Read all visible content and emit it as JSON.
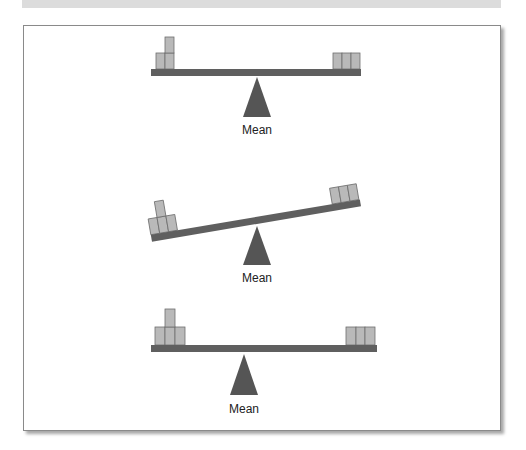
{
  "colors": {
    "beam": "#5f5f5f",
    "fulcrum": "#555555",
    "block_fill": "#b9b9b9",
    "block_stroke": "#6e6e6e",
    "frame_border": "#8a8a8a",
    "top_band": "#dcdcdc"
  },
  "seesaws": [
    {
      "id": "balanced-top",
      "fulcrum_label": "Mean",
      "left_blocks": {
        "count": 3,
        "arrangement": "2 bottom, 1 stacked"
      },
      "right_blocks": {
        "count": 3,
        "arrangement": "3 in a row"
      },
      "state": "balanced"
    },
    {
      "id": "tilted-middle",
      "fulcrum_label": "Mean",
      "left_blocks": {
        "count": 4,
        "arrangement": "3 bottom, 1 stacked"
      },
      "right_blocks": {
        "count": 3,
        "arrangement": "3 in a row"
      },
      "state": "tilted (left side down)"
    },
    {
      "id": "balanced-bottom",
      "fulcrum_label": "Mean",
      "left_blocks": {
        "count": 4,
        "arrangement": "3 bottom, 1 stacked"
      },
      "right_blocks": {
        "count": 3,
        "arrangement": "3 in a row"
      },
      "state": "balanced (fulcrum shifted left)"
    }
  ]
}
